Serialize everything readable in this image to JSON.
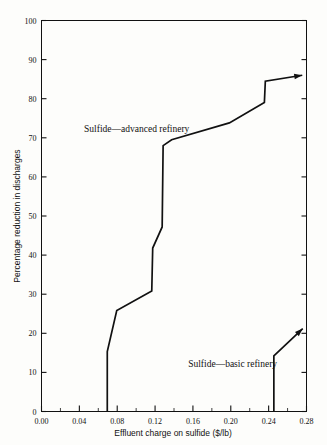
{
  "chart_data": {
    "type": "line",
    "title": "",
    "xlabel": "Effluent charge on sulfide ($/lb)",
    "ylabel": "Percentage reduction in discharges",
    "xlim": [
      0.0,
      0.28
    ],
    "ylim": [
      0,
      100
    ],
    "grid": false,
    "legend_position": "inline-annotations",
    "xticks": [
      "0.00",
      "0.04",
      "0.08",
      "0.12",
      "0.16",
      "0.20",
      "0.24",
      "0.28"
    ],
    "xtick_values": [
      0.0,
      0.04,
      0.08,
      0.12,
      0.16,
      0.2,
      0.24,
      0.28
    ],
    "xminor_values": [
      0.02,
      0.06,
      0.1,
      0.14,
      0.18,
      0.22,
      0.26
    ],
    "yticks": [
      "0",
      "10",
      "20",
      "30",
      "40",
      "50",
      "60",
      "70",
      "80",
      "90",
      "100"
    ],
    "ytick_values": [
      0,
      10,
      20,
      30,
      40,
      50,
      60,
      70,
      80,
      90,
      100
    ],
    "series": [
      {
        "name": "Sulfide—advanced refinery",
        "label_x": 0.045,
        "label_y": 71.5,
        "arrow_end": true,
        "points": [
          [
            0.0695,
            0.0
          ],
          [
            0.0695,
            15.3
          ],
          [
            0.0795,
            25.8
          ],
          [
            0.1165,
            30.8
          ],
          [
            0.1175,
            41.8
          ],
          [
            0.1275,
            47.2
          ],
          [
            0.1285,
            68.0
          ],
          [
            0.1375,
            69.5
          ],
          [
            0.1985,
            73.8
          ],
          [
            0.2355,
            79.0
          ],
          [
            0.2365,
            84.5
          ],
          [
            0.2755,
            86.0
          ]
        ]
      },
      {
        "name": "Sulfide—basic refinery",
        "label_x": 0.155,
        "label_y": 11.5,
        "arrow_end": true,
        "points": [
          [
            0.2455,
            0.0
          ],
          [
            0.2455,
            14.2
          ],
          [
            0.276,
            21.2
          ]
        ]
      }
    ],
    "annotations": [
      {
        "text": "Sulfide—advanced refinery",
        "x": 0.045,
        "y": 71.5
      },
      {
        "text": "Sulfide—basic refinery",
        "x": 0.155,
        "y": 11.5
      }
    ],
    "colors": {
      "line": "#111111",
      "axis": "#111111",
      "background": "#fdfdfb"
    }
  },
  "axes": {
    "x_title": "Effluent charge on sulfide ($/lb)",
    "y_title": "Percentage reduction in discharges"
  }
}
